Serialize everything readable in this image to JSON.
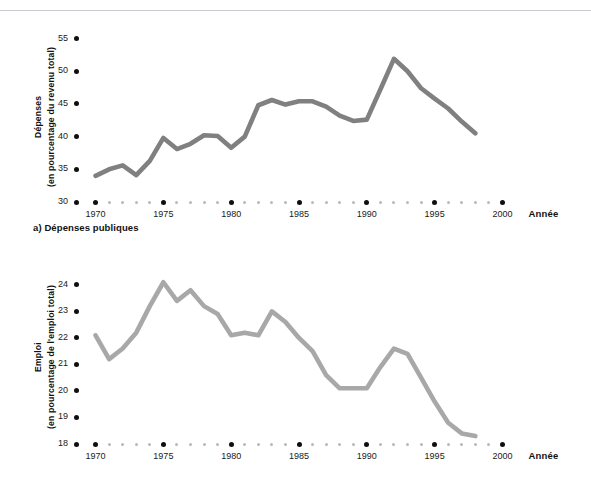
{
  "figure": {
    "panels": [
      {
        "id": "a",
        "caption": "a) Dépenses publiques",
        "y_axis_title_line1": "Dépenses",
        "y_axis_title_line2": "(en pourcentage du revenu total)",
        "x_axis_title": "Année",
        "y_tick_labels": [
          "55",
          "50",
          "45",
          "40",
          "35",
          "30"
        ],
        "x_tick_labels": [
          "1970",
          "1975",
          "1980",
          "1985",
          "1990",
          "1995",
          "2000"
        ],
        "line_color": "#808080"
      },
      {
        "id": "b",
        "caption": "",
        "y_axis_title_line1": "Emploi",
        "y_axis_title_line2": "(en pourcentage de l'emploi total)",
        "x_axis_title": "Année",
        "y_tick_labels": [
          "24",
          "23",
          "22",
          "21",
          "20",
          "19",
          "18"
        ],
        "x_tick_labels": [
          "1970",
          "1975",
          "1980",
          "1985",
          "1990",
          "1995",
          "2000"
        ],
        "line_color": "#a8a8a8"
      }
    ]
  },
  "chart_data": [
    {
      "type": "line",
      "title": "a) Dépenses publiques",
      "xlabel": "Année",
      "ylabel": "Dépenses (en pourcentage du revenu total)",
      "xlim": [
        1969,
        2001
      ],
      "ylim": [
        30,
        56
      ],
      "yticks": [
        30,
        35,
        40,
        45,
        50,
        55
      ],
      "xticks": [
        1970,
        1975,
        1980,
        1985,
        1990,
        1995,
        2000
      ],
      "grid": false,
      "legend": "none",
      "line_color": "#808080",
      "x": [
        1970,
        1971,
        1972,
        1973,
        1974,
        1975,
        1976,
        1977,
        1978,
        1979,
        1980,
        1981,
        1982,
        1983,
        1984,
        1985,
        1986,
        1987,
        1988,
        1989,
        1990,
        1991,
        1992,
        1993,
        1994,
        1995,
        1996,
        1997,
        1998
      ],
      "values": [
        34.0,
        35.0,
        35.6,
        34.1,
        36.3,
        39.8,
        38.1,
        38.9,
        40.2,
        40.1,
        38.3,
        40.0,
        44.8,
        45.6,
        44.9,
        45.4,
        45.4,
        44.6,
        43.2,
        42.4,
        42.6,
        47.2,
        51.9,
        50.0,
        47.4,
        45.8,
        44.3,
        42.3,
        40.5
      ]
    },
    {
      "type": "line",
      "title": "",
      "xlabel": "Année",
      "ylabel": "Emploi (en pourcentage de l'emploi total)",
      "xlim": [
        1969,
        2001
      ],
      "ylim": [
        18,
        24.6
      ],
      "yticks": [
        18,
        19,
        20,
        21,
        22,
        23,
        24
      ],
      "xticks": [
        1970,
        1975,
        1980,
        1985,
        1990,
        1995,
        2000
      ],
      "grid": false,
      "legend": "none",
      "line_color": "#a8a8a8",
      "x": [
        1970,
        1971,
        1972,
        1973,
        1974,
        1975,
        1976,
        1977,
        1978,
        1979,
        1980,
        1981,
        1982,
        1983,
        1984,
        1985,
        1986,
        1987,
        1988,
        1989,
        1990,
        1991,
        1992,
        1993,
        1994,
        1995,
        1996,
        1997,
        1998
      ],
      "values": [
        22.1,
        21.2,
        21.6,
        22.2,
        23.2,
        24.1,
        23.4,
        23.8,
        23.2,
        22.9,
        22.1,
        22.2,
        22.1,
        23.0,
        22.6,
        22.0,
        21.5,
        20.6,
        20.1,
        20.1,
        20.1,
        20.9,
        21.6,
        21.4,
        20.5,
        19.6,
        18.8,
        18.4,
        18.3
      ]
    }
  ]
}
